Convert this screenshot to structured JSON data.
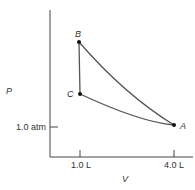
{
  "axes": {
    "y_label": "P",
    "x_label": "V",
    "y_tick_label": "1.0 atm",
    "x_tick_labels": [
      "1.0 L",
      "4.0 L"
    ]
  },
  "points": {
    "A": "A",
    "B": "B",
    "C": "C"
  },
  "colors": {
    "line": "#555555",
    "axis": "#444444",
    "point": "#111111"
  }
}
